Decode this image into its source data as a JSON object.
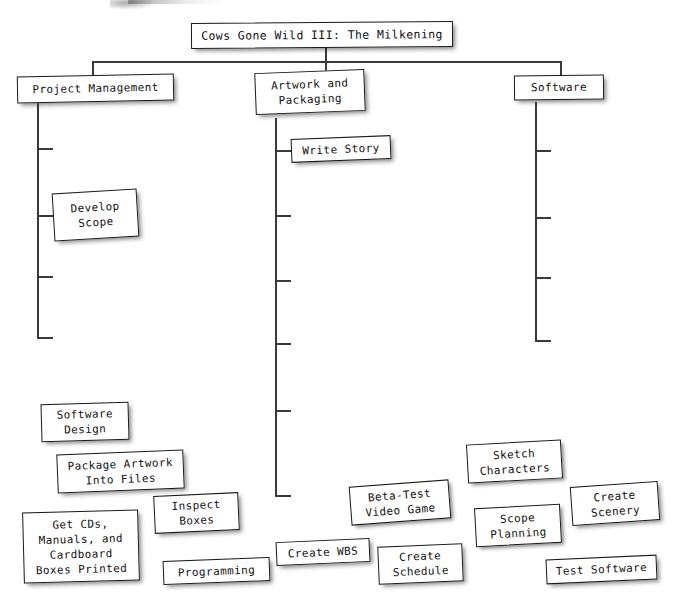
{
  "diagram": {
    "type": "work-breakdown-structure",
    "title": "Cows Gone Wild III: The Milkening",
    "root": {
      "label": "Cows Gone Wild III: The Milkening"
    },
    "branches": [
      {
        "label": "Project Management"
      },
      {
        "label": "Artwork and\nPackaging"
      },
      {
        "label": "Software"
      }
    ],
    "attached_nodes": [
      {
        "label": "Develop\nScope",
        "branch": "Project Management"
      },
      {
        "label": "Write Story",
        "branch": "Artwork and Packaging"
      }
    ],
    "loose_nodes": [
      {
        "label": "Software\nDesign"
      },
      {
        "label": "Package Artwork\nInto Files"
      },
      {
        "label": "Inspect\nBoxes"
      },
      {
        "label": "Get CDs,\nManuals, and\nCardboard\nBoxes Printed"
      },
      {
        "label": "Programming"
      },
      {
        "label": "Create WBS"
      },
      {
        "label": "Beta-Test\nVideo Game"
      },
      {
        "label": "Create\nSchedule"
      },
      {
        "label": "Sketch\nCharacters"
      },
      {
        "label": "Scope\nPlanning"
      },
      {
        "label": "Create\nScenery"
      },
      {
        "label": "Test Software"
      }
    ],
    "colors": {
      "box_fill": "#ffffff",
      "box_border": "#1a1a1a",
      "connector": "#3a3a3a",
      "text": "#111111",
      "background": "#ffffff"
    }
  }
}
